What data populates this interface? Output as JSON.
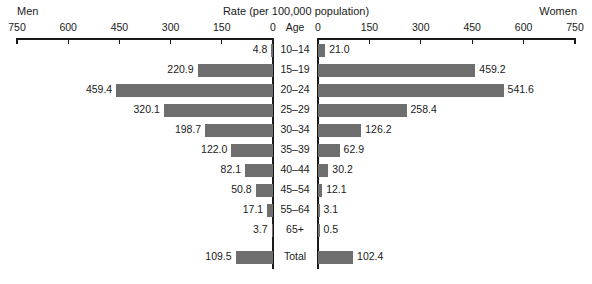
{
  "header": {
    "left_label": "Men",
    "title": "Rate (per 100,000 population)",
    "right_label": "Women",
    "center_axis_label": "Age"
  },
  "axis": {
    "left_ticks": [
      "750",
      "600",
      "450",
      "300",
      "150",
      "0"
    ],
    "right_ticks": [
      "0",
      "150",
      "300",
      "450",
      "600",
      "750"
    ],
    "max": 750,
    "min": 0,
    "tick_step": 150
  },
  "style": {
    "bar_color": "#6e6e6e",
    "axis_color": "#1a1a1a",
    "background": "#ffffff"
  },
  "chart_data": {
    "type": "bar",
    "title": "Rate (per 100,000 population)",
    "xlabel": "Rate (per 100,000 population)",
    "ylabel": "Age",
    "xlim": [
      0,
      750
    ],
    "grid": false,
    "orientation": "horizontal",
    "layout": "population-pyramid",
    "categories": [
      "10–14",
      "15–19",
      "20–24",
      "25–29",
      "30–34",
      "35–39",
      "40–44",
      "45–54",
      "55–64",
      "65+",
      "Total"
    ],
    "series": [
      {
        "name": "Men",
        "side": "left",
        "values": [
          4.8,
          220.9,
          459.4,
          320.1,
          198.7,
          122.0,
          82.1,
          50.8,
          17.1,
          3.7,
          109.5
        ],
        "labels": [
          "4.8",
          "220.9",
          "459.4",
          "320.1",
          "198.7",
          "122.0",
          "82.1",
          "50.8",
          "17.1",
          "3.7",
          "109.5"
        ]
      },
      {
        "name": "Women",
        "side": "right",
        "values": [
          21.0,
          459.2,
          541.6,
          258.4,
          126.2,
          62.9,
          30.2,
          12.1,
          3.1,
          0.5,
          102.4
        ],
        "labels": [
          "21.0",
          "459.2",
          "541.6",
          "258.4",
          "126.2",
          "62.9",
          "30.2",
          "12.1",
          "3.1",
          "0.5",
          "102.4"
        ]
      }
    ]
  }
}
